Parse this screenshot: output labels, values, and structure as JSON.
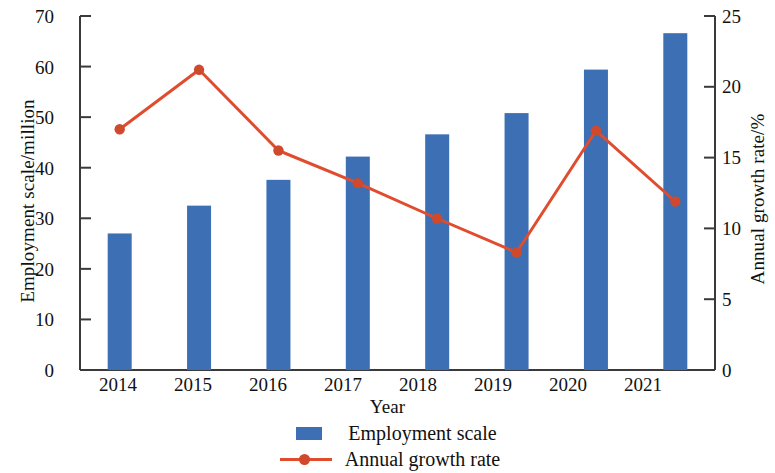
{
  "chart_data": {
    "type": "bar",
    "title": "",
    "subtitle": "",
    "xlabel": "Year",
    "ylabel": "Employment scale/million",
    "y2label": "Annual growth rate/%",
    "categories": [
      "2014",
      "2015",
      "2016",
      "2017",
      "2018",
      "2019",
      "2020",
      "2021"
    ],
    "ylim": [
      0,
      70
    ],
    "y2lim": [
      0,
      25
    ],
    "yticks": [
      0,
      10,
      20,
      30,
      40,
      50,
      60,
      70
    ],
    "y2ticks": [
      0,
      5,
      10,
      15,
      20,
      25
    ],
    "grid": false,
    "legend_position": "bottom",
    "series": [
      {
        "name": "Employment scale",
        "type": "bar",
        "axis": "left",
        "unit": "million",
        "color": "#3d6fb4",
        "values": [
          27.0,
          32.5,
          37.6,
          42.2,
          46.6,
          50.8,
          59.4,
          66.6
        ]
      },
      {
        "name": "Annual growth rate",
        "type": "line",
        "axis": "right",
        "unit": "%",
        "color": "#df4c2e",
        "marker": "circle",
        "values": [
          17.0,
          21.2,
          15.5,
          13.2,
          10.7,
          8.3,
          16.9,
          11.9
        ]
      }
    ]
  },
  "axes": {
    "left": {
      "title": "Employment scale/million",
      "tick_labels": [
        "0",
        "10",
        "20",
        "30",
        "40",
        "50",
        "60",
        "70"
      ]
    },
    "right": {
      "title": "Annual growth rate/%",
      "tick_labels": [
        "0",
        "5",
        "10",
        "15",
        "20",
        "25"
      ]
    },
    "bottom": {
      "title": "Year",
      "tick_labels": [
        "2014",
        "2015",
        "2016",
        "2017",
        "2018",
        "2019",
        "2020",
        "2021"
      ]
    }
  },
  "legend": {
    "items": [
      {
        "label": "Employment scale",
        "marker": "square-swatch",
        "color": "#3d6fb4"
      },
      {
        "label": "Annual growth rate",
        "marker": "line-with-circle",
        "color": "#df4c2e"
      }
    ]
  },
  "colors": {
    "bar": "#3d6fb4",
    "line": "#df4c2e",
    "marker": "#cf4a2c",
    "axis": "#3a3a3a",
    "text": "#111111",
    "background": "#ffffff"
  }
}
